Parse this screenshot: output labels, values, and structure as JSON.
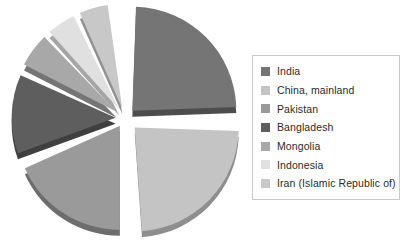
{
  "chart_data": {
    "type": "pie",
    "title": "",
    "subtitle": "",
    "xlabel": "",
    "ylabel": "",
    "exploded": true,
    "legend_position": "right",
    "grid": false,
    "categories": [
      "India",
      "China, mainland",
      "Pakistan",
      "Bangladesh",
      "Mongolia",
      "Indonesia",
      "Iran (Islamic Republic of)"
    ],
    "values": [
      24,
      25,
      19,
      13,
      7,
      6,
      6
    ],
    "colors": [
      "#757575",
      "#c4c4c4",
      "#9a9a9a",
      "#5e5e5e",
      "#a8a8a8",
      "#e0e0e0",
      "#c8c8c8"
    ],
    "slices": [
      {
        "label": "India",
        "value": 24,
        "color": "#757575",
        "edge": "#4d4d4d",
        "start_angle": 2,
        "end_angle": 88,
        "explode": 0.1
      },
      {
        "label": "China, mainland",
        "value": 25,
        "color": "#c4c4c4",
        "edge": "#8e8e8e",
        "start_angle": 92,
        "end_angle": 176,
        "explode": 0.13
      },
      {
        "label": "Pakistan",
        "value": 19,
        "color": "#9a9a9a",
        "edge": "#6d6d6d",
        "start_angle": 180,
        "end_angle": 246,
        "explode": 0.09
      },
      {
        "label": "Bangladesh",
        "value": 13,
        "color": "#5e5e5e",
        "edge": "#3f3f3f",
        "start_angle": 250,
        "end_angle": 294,
        "explode": 0.09
      },
      {
        "label": "Mongolia",
        "value": 7,
        "color": "#a8a8a8",
        "edge": "#757575",
        "start_angle": 297,
        "end_angle": 316,
        "explode": 0.1
      },
      {
        "label": "Indonesia",
        "value": 6,
        "color": "#e0e0e0",
        "edge": "#a5a5a5",
        "start_angle": 318,
        "end_angle": 334,
        "explode": 0.1
      },
      {
        "label": "Iran (Islamic Republic of)",
        "value": 6,
        "color": "#c8c8c8",
        "edge": "#919191",
        "start_angle": 336,
        "end_angle": 352,
        "explode": 0.1
      }
    ]
  },
  "legend": {
    "items": [
      {
        "label": "India",
        "color": "#757575"
      },
      {
        "label": "China, mainland",
        "color": "#c4c4c4"
      },
      {
        "label": "Pakistan",
        "color": "#9a9a9a"
      },
      {
        "label": "Bangladesh",
        "color": "#5e5e5e"
      },
      {
        "label": "Mongolia",
        "color": "#a8a8a8"
      },
      {
        "label": "Indonesia",
        "color": "#e0e0e0"
      },
      {
        "label": "Iran (Islamic Republic of)",
        "color": "#c8c8c8"
      }
    ]
  }
}
